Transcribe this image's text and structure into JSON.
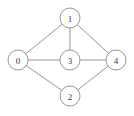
{
  "figure": {
    "name": "undirected-graph",
    "background_color": "#ffffff",
    "width": 134,
    "height": 116
  },
  "style": {
    "edge_color": "#8a8a8a",
    "edge_width": 0.9,
    "node_fill": "#ffffff",
    "node_stroke": "#8a8a8a",
    "node_stroke_width": 0.9,
    "node_radius": 10,
    "label_color": "#3a3a3a",
    "label_font_size": 9
  },
  "chart_data": {
    "type": "diagram",
    "graph_type": "undirected-node-link-graph",
    "title": "",
    "xlabel": "",
    "ylabel": "",
    "grid": false,
    "legend": false,
    "node_count": 5,
    "edge_count": 7,
    "nodes": [
      {
        "id": "0",
        "label": "0",
        "x": 18,
        "y": 60,
        "r": 10
      },
      {
        "id": "1",
        "label": "1",
        "x": 70,
        "y": 18,
        "r": 10
      },
      {
        "id": "2",
        "label": "2",
        "x": 70,
        "y": 96,
        "r": 10
      },
      {
        "id": "3",
        "label": "3",
        "x": 70,
        "y": 60,
        "r": 10
      },
      {
        "id": "4",
        "label": "4",
        "x": 116,
        "y": 60,
        "r": 10
      }
    ],
    "edges": [
      {
        "source": "0",
        "target": "1"
      },
      {
        "source": "0",
        "target": "3"
      },
      {
        "source": "0",
        "target": "2"
      },
      {
        "source": "1",
        "target": "3"
      },
      {
        "source": "1",
        "target": "4"
      },
      {
        "source": "3",
        "target": "4"
      },
      {
        "source": "2",
        "target": "4"
      }
    ],
    "adjacency": {
      "0": [
        "1",
        "2",
        "3"
      ],
      "1": [
        "0",
        "3",
        "4"
      ],
      "2": [
        "0",
        "4"
      ],
      "3": [
        "0",
        "1",
        "4"
      ],
      "4": [
        "1",
        "2",
        "3"
      ]
    }
  }
}
